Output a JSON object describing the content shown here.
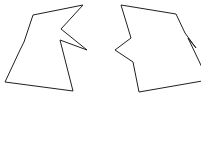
{
  "canvas": {
    "width": 201,
    "height": 142,
    "background_color": "#ffffff",
    "description": "Two irregular jagged polygon outlines side by side on a plain white background"
  },
  "style": {
    "stroke_color": "#231f20",
    "fill_color": "#ffffff",
    "stroke_width": 1
  },
  "shapes": [
    {
      "name": "left-jagged-polygon",
      "label": "Left jagged polygon",
      "vertex_count": 9,
      "clipped": false,
      "points": "33,15 83,5 61,29 87,50 60,40 73,91 5,82 20,50 24,42"
    },
    {
      "name": "right-jagged-polygon",
      "label": "Right jagged polygon (clipped at right edge)",
      "vertex_count": 9,
      "clipped": true,
      "points": "121,5 176,14 185,33 196,48 188,38 208,80 139,92 133,62 115,50 131,38"
    }
  ]
}
